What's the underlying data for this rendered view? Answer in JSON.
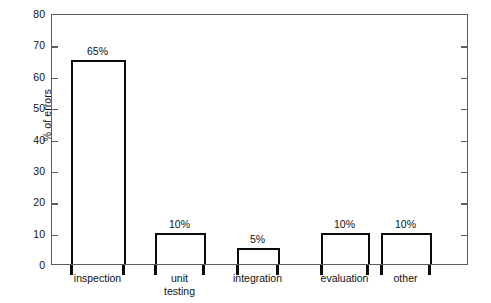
{
  "chart_data": {
    "type": "bar",
    "title": "",
    "subtitle": "",
    "xlabel": "",
    "ylabel": "% of errors",
    "ylim": [
      0,
      80
    ],
    "ytick_step": 10,
    "yticks": [
      0,
      10,
      20,
      30,
      40,
      50,
      60,
      70,
      80
    ],
    "ytick_labels": [
      "0",
      "10",
      "20",
      "30",
      "40",
      "50",
      "60",
      "70",
      "80"
    ],
    "grid": false,
    "legend": null,
    "categories": [
      "inspection",
      "unit\ntesting",
      "integration",
      "evaluation",
      "other"
    ],
    "values": [
      65,
      10,
      5,
      10,
      10
    ],
    "data_labels": [
      "65%",
      "10%",
      "5%",
      "10%",
      "10%"
    ],
    "colors": {
      "bar_fill": "#ffffff",
      "bar_edge": "#0a0a0a",
      "frame": "#5e5e5e",
      "background": "#ffffff",
      "text": "#111111"
    }
  }
}
